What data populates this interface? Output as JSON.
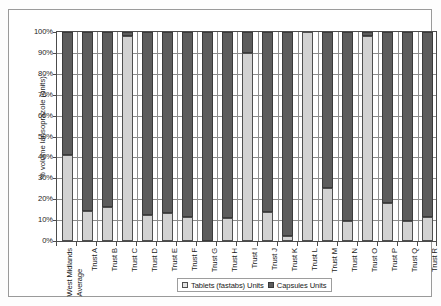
{
  "chart_data": {
    "type": "bar",
    "stacked": true,
    "title": "",
    "xlabel": "",
    "ylabel": "% volume lansoprazole (units).",
    "ylim": [
      0,
      100
    ],
    "ytick_labels": [
      "100%",
      "90%",
      "80%",
      "70%",
      "60%",
      "50%",
      "40%",
      "30%",
      "20%",
      "10%",
      "0%"
    ],
    "ytick_values": [
      100,
      90,
      80,
      70,
      60,
      50,
      40,
      30,
      20,
      10,
      0
    ],
    "grid": true,
    "legend_position": "bottom",
    "categories": [
      "West Midlands Average",
      "Trust A",
      "Trust B",
      "Trust C",
      "Trust D",
      "Trust E",
      "Trust F",
      "Trust G",
      "Trust H",
      "Trust I",
      "Trust J",
      "Trust K",
      "Trust L",
      "Trust M",
      "Trust N",
      "Trust O",
      "Trust P",
      "Trust Q",
      "Trust R"
    ],
    "category_lines": [
      [
        "West Midlands",
        "Average"
      ],
      [
        "Trust A"
      ],
      [
        "Trust B"
      ],
      [
        "Trust C"
      ],
      [
        "Trust D"
      ],
      [
        "Trust E"
      ],
      [
        "Trust F"
      ],
      [
        "Trust G"
      ],
      [
        "Trust H"
      ],
      [
        "Trust I"
      ],
      [
        "Trust J"
      ],
      [
        "Trust K"
      ],
      [
        "Trust L"
      ],
      [
        "Trust M"
      ],
      [
        "Trust N"
      ],
      [
        "Trust O"
      ],
      [
        "Trust P"
      ],
      [
        "Trust Q"
      ],
      [
        "Trust R"
      ]
    ],
    "series": [
      {
        "name": "Tablets (fastabs) Units",
        "color": "#d2d2d2",
        "values": [
          41,
          14.5,
          16.5,
          98,
          12.5,
          13.5,
          11.5,
          0,
          11,
          90,
          14,
          2.5,
          100,
          25.5,
          9.5,
          98,
          18,
          9.5,
          11.5
        ]
      },
      {
        "name": "Capsules Units",
        "color": "#5c5c5c",
        "values": [
          59,
          85.5,
          83.5,
          2,
          87.5,
          86.5,
          88.5,
          100,
          89,
          10,
          86,
          97.5,
          0,
          74.5,
          90.5,
          2,
          82,
          90.5,
          88.5
        ]
      }
    ]
  },
  "legend": {
    "items": [
      {
        "label": "Tablets (fastabs) Units",
        "swatch": "tablets"
      },
      {
        "label": "Capsules Units",
        "swatch": "capsules"
      }
    ]
  }
}
